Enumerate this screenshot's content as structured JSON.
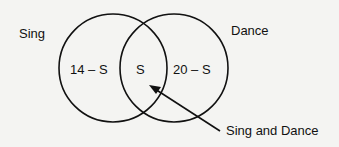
{
  "diagram": {
    "type": "venn",
    "sets": [
      {
        "name": "Sing",
        "region_label": "14 – S"
      },
      {
        "name": "Dance",
        "region_label": "20 – S"
      }
    ],
    "intersection_label": "S",
    "callout": "Sing and Dance"
  }
}
